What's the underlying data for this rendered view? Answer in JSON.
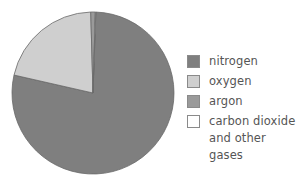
{
  "chart_data": {
    "type": "pie",
    "title": "",
    "categories": [
      "nitrogen",
      "oxygen",
      "argon",
      "carbon dioxide and other gases"
    ],
    "values": [
      78,
      21,
      0.9,
      0.1
    ],
    "unit": "%",
    "colors": [
      "#7f7f7f",
      "#cfcfcf",
      "#9a9a9a",
      "#ffffff"
    ],
    "start_angle_deg": 2,
    "direction": "clockwise",
    "legend_position": "right"
  },
  "legend": {
    "items": [
      {
        "label": "nitrogen",
        "color": "#7f7f7f"
      },
      {
        "label": "oxygen",
        "color": "#cfcfcf"
      },
      {
        "label": "argon",
        "color": "#9a9a9a"
      },
      {
        "label_line1": "carbon dioxide",
        "label_line2": "and other gases",
        "color": "#ffffff"
      }
    ]
  }
}
